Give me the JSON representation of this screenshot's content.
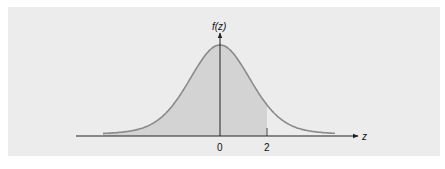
{
  "chart_data": {
    "type": "area",
    "title": "",
    "xlabel": "z",
    "ylabel": "f(z)",
    "x_ticks": [
      "0",
      "2"
    ],
    "x_tick_values": [
      0,
      2
    ],
    "shaded_region": {
      "from": "-inf",
      "to": 2
    },
    "grid": false,
    "legend": null,
    "colors": {
      "background": "#ececec",
      "shade": "#d3d3d3",
      "curve": "#8a8a8a",
      "axis": "#222222"
    }
  },
  "labels": {
    "y_axis": "f(z)",
    "x_axis": "z",
    "tick_zero": "0",
    "tick_two": "2"
  }
}
